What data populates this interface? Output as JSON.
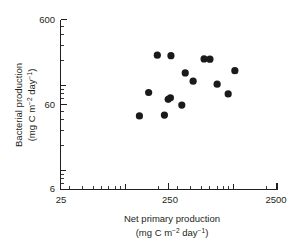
{
  "chart_data": {
    "type": "scatter",
    "title": "",
    "xlabel": "Net primary production",
    "xlabel_units": "(mg C m−2 day−1)",
    "ylabel": "Bacterial production",
    "ylabel_units": "(mg C m−2 day−1)",
    "xscale": "log",
    "yscale": "log",
    "xlim": [
      25,
      2500
    ],
    "ylim": [
      6,
      600
    ],
    "grid": false,
    "legend": null,
    "x_tick_labels": [
      "25",
      "250",
      "2500"
    ],
    "x_tick_values": [
      25,
      250,
      2500
    ],
    "y_tick_labels": [
      "6",
      "60",
      "600"
    ],
    "y_tick_values": [
      6,
      60,
      600
    ],
    "marker": "filled-circle",
    "marker_color": "#1a1a1a",
    "points": [
      {
        "x": 196,
        "y": 228
      },
      {
        "x": 262,
        "y": 225
      },
      {
        "x": 530,
        "y": 206
      },
      {
        "x": 600,
        "y": 205
      },
      {
        "x": 1020,
        "y": 150
      },
      {
        "x": 355,
        "y": 141
      },
      {
        "x": 420,
        "y": 113
      },
      {
        "x": 700,
        "y": 104
      },
      {
        "x": 163,
        "y": 83
      },
      {
        "x": 885,
        "y": 80
      },
      {
        "x": 247,
        "y": 69
      },
      {
        "x": 259,
        "y": 72
      },
      {
        "x": 330,
        "y": 59
      },
      {
        "x": 134,
        "y": 44
      },
      {
        "x": 228,
        "y": 45
      }
    ]
  },
  "axis_labels": {
    "x_low": "25",
    "x_mid": "250",
    "x_high": "2500",
    "y_low": "6",
    "y_mid": "60",
    "y_high": "600"
  },
  "titles": {
    "x_line1": "Net primary production",
    "x_unit_prefix": "(mg C m",
    "x_unit_exp1": "−2",
    "x_unit_mid": " day",
    "x_unit_exp2": "−1",
    "x_unit_suffix": ")",
    "y_line1": "Bacterial production",
    "y_unit_prefix": "(mg C m",
    "y_unit_exp1": "−2",
    "y_unit_mid": " day",
    "y_unit_exp2": "−1",
    "y_unit_suffix": ")"
  },
  "colors": {
    "axis": "#231f20",
    "marker": "#1a1a1a",
    "background": "#ffffff"
  }
}
